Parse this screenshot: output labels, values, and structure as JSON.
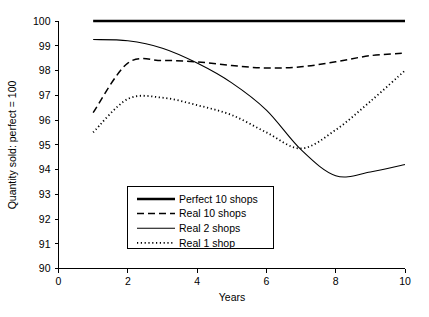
{
  "chart_data": {
    "type": "line",
    "title": "",
    "xlabel": "Years",
    "ylabel": "Quantity sold: perfect = 100",
    "xlim": [
      0,
      10
    ],
    "ylim": [
      90,
      100
    ],
    "xticks": [
      0,
      2,
      4,
      6,
      8,
      10
    ],
    "xtick_labels": [
      "0",
      "2",
      "4",
      "6",
      "8",
      "10"
    ],
    "yticks": [
      90,
      91,
      92,
      93,
      94,
      95,
      96,
      97,
      98,
      99,
      100
    ],
    "ytick_labels": [
      "90",
      "91",
      "92",
      "93",
      "94",
      "95",
      "96",
      "97",
      "98",
      "99",
      "100"
    ],
    "grid": false,
    "legend_position": "center-left-lower",
    "x": [
      1,
      2,
      3,
      4,
      5,
      6,
      7,
      8,
      9,
      10
    ],
    "series": [
      {
        "name": "Perfect 10 shops",
        "style": "solid-thick",
        "stroke_width": 2.6,
        "dasharray": "none",
        "values": [
          100,
          100,
          100,
          100,
          100,
          100,
          100,
          100,
          100,
          100
        ]
      },
      {
        "name": "Real 10 shops",
        "style": "dashed",
        "stroke_width": 1.5,
        "dasharray": "7,4",
        "values": [
          96.3,
          98.3,
          98.4,
          98.35,
          98.2,
          98.1,
          98.15,
          98.35,
          98.6,
          98.7
        ]
      },
      {
        "name": "Real 2 shops",
        "style": "solid-thin",
        "stroke_width": 1.1,
        "dasharray": "none",
        "values": [
          99.25,
          99.2,
          98.9,
          98.3,
          97.5,
          96.4,
          94.8,
          93.75,
          93.9,
          94.2
        ]
      },
      {
        "name": "Real 1 shop",
        "style": "dotted",
        "stroke_width": 1.8,
        "dasharray": "1.2,2.6",
        "values": [
          95.5,
          96.85,
          96.9,
          96.6,
          96.2,
          95.5,
          94.85,
          95.6,
          96.75,
          98.0
        ]
      }
    ],
    "legend": [
      {
        "label": "Perfect 10 shops",
        "style": "solid-thick"
      },
      {
        "label": "Real 10 shops",
        "style": "dashed"
      },
      {
        "label": "Real 2 shops",
        "style": "solid-thin"
      },
      {
        "label": "Real 1 shop",
        "style": "dotted"
      }
    ],
    "colors": {
      "line": "#000000",
      "axis": "#000000",
      "background": "#ffffff"
    }
  }
}
